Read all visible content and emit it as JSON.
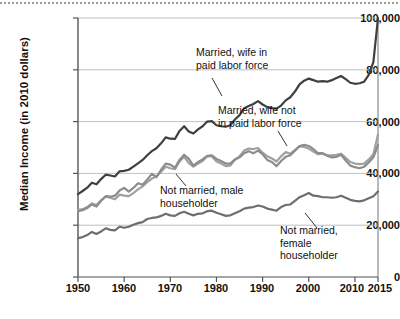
{
  "chart_data": {
    "type": "line",
    "title": "",
    "xlabel": "",
    "ylabel": "Median Income (in 2010 dollars)",
    "xlim": [
      1950,
      2015
    ],
    "ylim": [
      0,
      100000
    ],
    "xticks": [
      1950,
      1960,
      1970,
      1980,
      1990,
      2000,
      2010,
      2015
    ],
    "xtick_labels": [
      "1950",
      "1960",
      "1970",
      "1980",
      "1990",
      "2000",
      "2010",
      "2015"
    ],
    "yticks": [
      0,
      20000,
      40000,
      60000,
      80000,
      100000
    ],
    "ytick_labels": [
      "0",
      "20,000",
      "40,000",
      "60,000",
      "80,000",
      "100,000"
    ],
    "grid": "horizontal",
    "legend": "inline-annotations",
    "series": [
      {
        "name": "Married, wife in paid labor force",
        "color": "#3f3f3f",
        "x": [
          1950,
          1951,
          1952,
          1953,
          1954,
          1955,
          1956,
          1957,
          1958,
          1959,
          1960,
          1961,
          1962,
          1963,
          1964,
          1965,
          1966,
          1967,
          1968,
          1969,
          1970,
          1971,
          1972,
          1973,
          1974,
          1975,
          1976,
          1977,
          1978,
          1979,
          1980,
          1981,
          1982,
          1983,
          1984,
          1985,
          1986,
          1987,
          1988,
          1989,
          1990,
          1991,
          1992,
          1993,
          1994,
          1995,
          1996,
          1997,
          1998,
          1999,
          2000,
          2001,
          2002,
          2003,
          2004,
          2005,
          2006,
          2007,
          2008,
          2009,
          2010,
          2011,
          2012,
          2013,
          2014,
          2015
        ],
        "y": [
          32000,
          33200,
          34500,
          36400,
          35800,
          37800,
          39500,
          39200,
          38800,
          40800,
          41000,
          41400,
          42600,
          43900,
          45200,
          47000,
          48600,
          49700,
          51600,
          53900,
          53400,
          53300,
          56400,
          58200,
          56200,
          55400,
          57000,
          58200,
          60000,
          60200,
          58600,
          58200,
          58000,
          58600,
          60800,
          62500,
          65200,
          66000,
          66800,
          67900,
          66600,
          65600,
          65200,
          65000,
          66200,
          68200,
          69400,
          71600,
          74400,
          75800,
          76600,
          76000,
          75400,
          75600,
          75400,
          76000,
          76800,
          77600,
          76400,
          75000,
          74600,
          74800,
          75400,
          78000,
          83000,
          100000
        ]
      },
      {
        "name": "Married, wife not in paid labor force",
        "color": "#a0a0a0",
        "x": [
          1950,
          1951,
          1952,
          1953,
          1954,
          1955,
          1956,
          1957,
          1958,
          1959,
          1960,
          1961,
          1962,
          1963,
          1964,
          1965,
          1966,
          1967,
          1968,
          1969,
          1970,
          1971,
          1972,
          1973,
          1974,
          1975,
          1976,
          1977,
          1978,
          1979,
          1980,
          1981,
          1982,
          1983,
          1984,
          1985,
          1986,
          1987,
          1988,
          1989,
          1990,
          1991,
          1992,
          1993,
          1994,
          1995,
          1996,
          1997,
          1998,
          1999,
          2000,
          2001,
          2002,
          2003,
          2004,
          2005,
          2006,
          2007,
          2008,
          2009,
          2010,
          2011,
          2012,
          2013,
          2014,
          2015
        ],
        "y": [
          25800,
          26200,
          27000,
          28400,
          27800,
          29600,
          31000,
          30600,
          30000,
          31800,
          31400,
          31200,
          32400,
          33800,
          35000,
          36600,
          38000,
          38800,
          40600,
          42600,
          42000,
          41600,
          44600,
          46400,
          44000,
          42600,
          43800,
          44800,
          46600,
          46600,
          44600,
          43800,
          42800,
          43000,
          45200,
          46600,
          48800,
          49600,
          49400,
          49800,
          48000,
          46600,
          45800,
          44600,
          46600,
          48200,
          47600,
          49000,
          50400,
          50200,
          49600,
          48400,
          47400,
          47600,
          47000,
          47000,
          47200,
          47600,
          46000,
          44400,
          43800,
          43600,
          43800,
          45400,
          47400,
          55000
        ]
      },
      {
        "name": "Not married, male householder",
        "color": "#8c8c8c",
        "x": [
          1950,
          1951,
          1952,
          1953,
          1954,
          1955,
          1956,
          1957,
          1958,
          1959,
          1960,
          1961,
          1962,
          1963,
          1964,
          1965,
          1966,
          1967,
          1968,
          1969,
          1970,
          1971,
          1972,
          1973,
          1974,
          1975,
          1976,
          1977,
          1978,
          1979,
          1980,
          1981,
          1982,
          1983,
          1984,
          1985,
          1986,
          1987,
          1988,
          1989,
          1990,
          1991,
          1992,
          1993,
          1994,
          1995,
          1996,
          1997,
          1998,
          1999,
          2000,
          2001,
          2002,
          2003,
          2004,
          2005,
          2006,
          2007,
          2008,
          2009,
          2010,
          2011,
          2012,
          2013,
          2014,
          2015
        ],
        "y": [
          25400,
          25800,
          26600,
          28000,
          27200,
          29400,
          31200,
          31000,
          31400,
          33400,
          34400,
          33000,
          34400,
          36200,
          35600,
          37600,
          39800,
          38600,
          41400,
          43800,
          43400,
          42200,
          45200,
          47200,
          45600,
          43000,
          44400,
          45400,
          46800,
          47000,
          45600,
          44800,
          43800,
          43800,
          45400,
          46200,
          47800,
          48600,
          47800,
          48800,
          47400,
          45200,
          44400,
          42800,
          44800,
          46400,
          47000,
          48800,
          50600,
          51000,
          50600,
          49400,
          47800,
          47800,
          46800,
          46200,
          46400,
          47200,
          45000,
          43000,
          42400,
          42000,
          42600,
          44200,
          46200,
          51000
        ]
      },
      {
        "name": "Not married, female householder",
        "color": "#6e6e6e",
        "x": [
          1950,
          1951,
          1952,
          1953,
          1954,
          1955,
          1956,
          1957,
          1958,
          1959,
          1960,
          1961,
          1962,
          1963,
          1964,
          1965,
          1966,
          1967,
          1968,
          1969,
          1970,
          1971,
          1972,
          1973,
          1974,
          1975,
          1976,
          1977,
          1978,
          1979,
          1980,
          1981,
          1982,
          1983,
          1984,
          1985,
          1986,
          1987,
          1988,
          1989,
          1990,
          1991,
          1992,
          1993,
          1994,
          1995,
          1996,
          1997,
          1998,
          1999,
          2000,
          2001,
          2002,
          2003,
          2004,
          2005,
          2006,
          2007,
          2008,
          2009,
          2010,
          2011,
          2012,
          2013,
          2014,
          2015
        ],
        "y": [
          15000,
          15400,
          16200,
          17400,
          16600,
          17600,
          18800,
          18200,
          18000,
          19400,
          19000,
          19400,
          20200,
          20800,
          21200,
          22400,
          22800,
          23000,
          23600,
          24400,
          23800,
          23600,
          24600,
          25200,
          24400,
          23800,
          24400,
          24600,
          25400,
          25600,
          24800,
          24200,
          23600,
          23800,
          24600,
          25400,
          26400,
          26800,
          27000,
          27600,
          27200,
          26400,
          26000,
          25600,
          27000,
          27800,
          28000,
          29400,
          30800,
          31600,
          32400,
          31400,
          31200,
          30800,
          30800,
          30600,
          30800,
          31400,
          30600,
          29800,
          29400,
          29200,
          29600,
          30400,
          31200,
          33000
        ]
      }
    ],
    "annotations": [
      {
        "name": "married-wife-in-labor-force",
        "lines": [
          "Married, wife in",
          "paid labor force"
        ]
      },
      {
        "name": "married-wife-not-in-labor-force",
        "lines": [
          "Married, wife not",
          "in paid labor force"
        ]
      },
      {
        "name": "not-married-male-householder",
        "lines": [
          "Not married, male",
          "householder"
        ]
      },
      {
        "name": "not-married-female-householder",
        "lines": [
          "Not married,",
          "female",
          "householder"
        ]
      }
    ]
  },
  "axis": {
    "y_title": "Median Income (in 2010 dollars)"
  }
}
